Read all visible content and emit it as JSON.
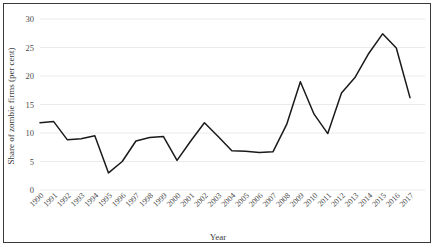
{
  "chart_data": {
    "type": "line",
    "title": "",
    "xlabel": "Year",
    "ylabel": "Share of zombie firms (per cent)",
    "xlim": [
      1990,
      2017
    ],
    "ylim": [
      0,
      30
    ],
    "ytick_labels": [
      "0",
      "5",
      "10",
      "15",
      "20",
      "25",
      "30"
    ],
    "yticks": [
      0,
      5,
      10,
      15,
      20,
      25,
      30
    ],
    "grid": "horizontal",
    "legend": "none",
    "line_color": "#1a1a1a",
    "categories": [
      "1990",
      "1991",
      "1992",
      "1993",
      "1994",
      "1995",
      "1996",
      "1997",
      "1998",
      "1999",
      "2000",
      "2001",
      "2002",
      "2003",
      "2004",
      "2005",
      "2006",
      "2007",
      "2008",
      "2009",
      "2010",
      "2011",
      "2012",
      "2013",
      "2014",
      "2015",
      "2016",
      "2017"
    ],
    "values": [
      11.8,
      12.0,
      8.8,
      9.0,
      9.5,
      3.0,
      5.0,
      8.6,
      9.2,
      9.4,
      5.2,
      8.6,
      11.8,
      9.4,
      6.9,
      6.8,
      6.6,
      6.7,
      11.5,
      19.0,
      13.3,
      9.9,
      17.0,
      19.8,
      24.0,
      27.4,
      24.9,
      16.2
    ],
    "series": [
      {
        "name": "Share of zombie firms",
        "values": [
          11.8,
          12.0,
          8.8,
          9.0,
          9.5,
          3.0,
          5.0,
          8.6,
          9.2,
          9.4,
          5.2,
          8.6,
          11.8,
          9.4,
          6.9,
          6.8,
          6.6,
          6.7,
          11.5,
          19.0,
          13.3,
          9.9,
          17.0,
          19.8,
          24.0,
          27.4,
          24.9,
          16.2
        ]
      }
    ]
  }
}
